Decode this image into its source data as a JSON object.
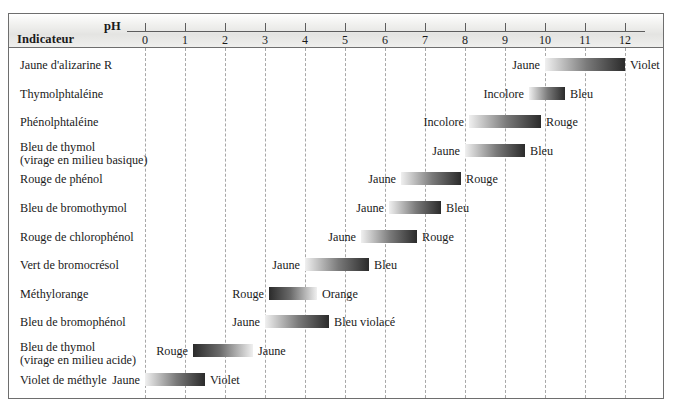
{
  "header": {
    "indicator_column_title": "Indicateur",
    "ph_axis_label": "pH"
  },
  "axis": {
    "min": 0,
    "max": 12,
    "ticks": [
      0,
      1,
      2,
      3,
      4,
      5,
      6,
      7,
      8,
      9,
      10,
      11,
      12
    ],
    "tick_labels": [
      "0",
      "1",
      "2",
      "3",
      "4",
      "5",
      "6",
      "7",
      "8",
      "9",
      "10",
      "11",
      "12"
    ],
    "px_at_ph0": 145,
    "px_per_ph": 40
  },
  "colors": {
    "frame": "#6e6e6e",
    "gridline": "#a8a8a8",
    "header_bg": "#e4e4e2",
    "bar_light": "#f0f0f0",
    "bar_dark": "#2b2b2b",
    "text": "#1a1a1a"
  },
  "chart_data": {
    "type": "bar",
    "title": "Indicateur",
    "xlabel": "pH",
    "ylabel": "",
    "xlim": [
      0,
      12
    ],
    "grid": true,
    "legend": "none",
    "orientation": "horizontal-range",
    "categories": [
      "Jaune d'alizarine R",
      "Thymolphtaléine",
      "Phénolphtaléine",
      "Bleu de thymol (virage en milieu basique)",
      "Rouge de phénol",
      "Bleu de bromothymol",
      "Rouge de chlorophénol",
      "Vert de bromocrésol",
      "Méthylorange",
      "Bleu de bromophénol",
      "Bleu de thymol (virage en milieu acide)",
      "Violet de méthyle"
    ],
    "values": [
      [
        10.0,
        12.0
      ],
      [
        9.6,
        10.5
      ],
      [
        8.1,
        9.9
      ],
      [
        8.0,
        9.5
      ],
      [
        6.4,
        7.9
      ],
      [
        6.1,
        7.4
      ],
      [
        5.4,
        6.8
      ],
      [
        4.0,
        5.6
      ],
      [
        3.1,
        4.3
      ],
      [
        3.0,
        4.6
      ],
      [
        1.2,
        2.7
      ],
      [
        0.0,
        1.5
      ]
    ]
  },
  "rows": [
    {
      "name": "Jaune d'alizarine R",
      "name_line2": "",
      "ph_start": 10.0,
      "ph_end": 12.0,
      "left_label": "Jaune",
      "right_label": "Violet",
      "gradient": "light-to-dark"
    },
    {
      "name": "Thymolphtaléine",
      "name_line2": "",
      "ph_start": 9.6,
      "ph_end": 10.5,
      "left_label": "Incolore",
      "right_label": "Bleu",
      "gradient": "light-to-dark"
    },
    {
      "name": "Phénolphtaléine",
      "name_line2": "",
      "ph_start": 8.1,
      "ph_end": 9.9,
      "left_label": "Incolore",
      "right_label": "Rouge",
      "gradient": "light-to-dark"
    },
    {
      "name": "Bleu de thymol",
      "name_line2": "(virage en milieu basique)",
      "ph_start": 8.0,
      "ph_end": 9.5,
      "left_label": "Jaune",
      "right_label": "Bleu",
      "gradient": "light-to-dark"
    },
    {
      "name": "Rouge de phénol",
      "name_line2": "",
      "ph_start": 6.4,
      "ph_end": 7.9,
      "left_label": "Jaune",
      "right_label": "Rouge",
      "gradient": "light-to-dark"
    },
    {
      "name": "Bleu de bromothymol",
      "name_line2": "",
      "ph_start": 6.1,
      "ph_end": 7.4,
      "left_label": "Jaune",
      "right_label": "Bleu",
      "gradient": "light-to-dark"
    },
    {
      "name": "Rouge de chlorophénol",
      "name_line2": "",
      "ph_start": 5.4,
      "ph_end": 6.8,
      "left_label": "Jaune",
      "right_label": "Rouge",
      "gradient": "light-to-dark"
    },
    {
      "name": "Vert de bromocrésol",
      "name_line2": "",
      "ph_start": 4.0,
      "ph_end": 5.6,
      "left_label": "Jaune",
      "right_label": "Bleu",
      "gradient": "light-to-dark"
    },
    {
      "name": "Méthylorange",
      "name_line2": "",
      "ph_start": 3.1,
      "ph_end": 4.3,
      "left_label": "Rouge",
      "right_label": "Orange",
      "gradient": "dark-to-light"
    },
    {
      "name": "Bleu de bromophénol",
      "name_line2": "",
      "ph_start": 3.0,
      "ph_end": 4.6,
      "left_label": "Jaune",
      "right_label": "Bleu violacé",
      "gradient": "light-to-dark"
    },
    {
      "name": "Bleu de thymol",
      "name_line2": "(virage en milieu acide)",
      "ph_start": 1.2,
      "ph_end": 2.7,
      "left_label": "Rouge",
      "right_label": "Jaune",
      "gradient": "dark-to-light"
    },
    {
      "name": "Violet de méthyle",
      "name_line2": "",
      "ph_start": 0.0,
      "ph_end": 1.5,
      "left_label": "Jaune",
      "right_label": "Violet",
      "gradient": "light-to-dark"
    }
  ]
}
